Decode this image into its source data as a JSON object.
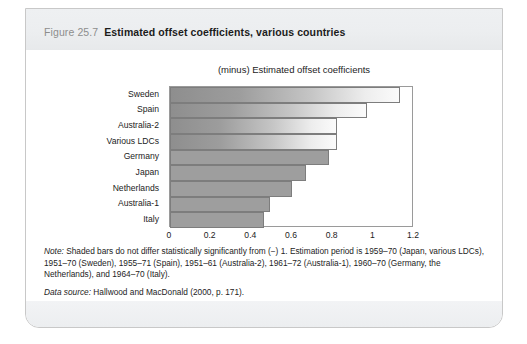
{
  "figure": {
    "number": "Figure 25.7",
    "caption": "Estimated offset coefficients, various countries"
  },
  "notes": {
    "note_label": "Note:",
    "note_text": " Shaded bars do not differ statistically significantly from (−) 1. Estimation period is 1959–70 (Japan, various LDCs), 1951–70 (Sweden), 1955–71 (Spain), 1951–61 (Australia-2), 1961–72 (Australia-1), 1960–70 (Germany, the Netherlands), and 1964–70 (Italy).",
    "source_label": "Data source:",
    "source_text": " Hallwood and MacDonald (2000, p. 171)."
  },
  "chart_data": {
    "type": "bar",
    "orientation": "horizontal",
    "title": "(minus) Estimated offset coefficients",
    "xlabel": "",
    "ylabel": "",
    "xlim": [
      0,
      1.2
    ],
    "xticks": [
      "0",
      "0.2",
      "0.4",
      "0.6",
      "0.8",
      "1",
      "1.2"
    ],
    "xtick_values": [
      0,
      0.2,
      0.4,
      0.6,
      0.8,
      1,
      1.2
    ],
    "grid": false,
    "legend": "none",
    "categories": [
      "Sweden",
      "Spain",
      "Australia-2",
      "Various LDCs",
      "Germany",
      "Japan",
      "Netherlands",
      "Australia-1",
      "Italy"
    ],
    "values": [
      1.13,
      0.97,
      0.82,
      0.82,
      0.78,
      0.67,
      0.6,
      0.49,
      0.46
    ],
    "bar_styles": [
      "shaded",
      "shaded",
      "shaded",
      "shaded",
      "solid",
      "solid",
      "solid",
      "solid",
      "solid"
    ],
    "colors": {
      "solid_bar": "#9e9e9e",
      "bar_outline": "#7d7d7d",
      "shaded_bar_start": "#8e8e8e",
      "shaded_bar_end": "#fbfbfb",
      "axis": "#9a9a9a",
      "header_band": "#eceef0",
      "text": "#1c1c1c"
    }
  }
}
